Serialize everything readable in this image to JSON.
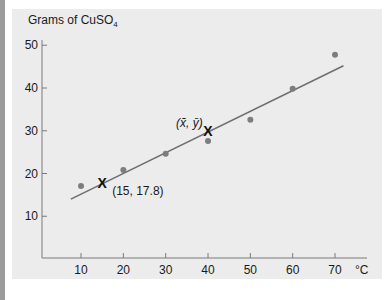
{
  "chart_data": {
    "type": "scatter",
    "title": "",
    "ylabel": "Grams of CuSO4",
    "ylabel_main": "Grams of CuSO",
    "ylabel_sub": "4",
    "xlabel": "°C",
    "xlim": [
      0,
      75
    ],
    "ylim": [
      0,
      50
    ],
    "x_ticks": [
      10,
      20,
      30,
      40,
      50,
      60,
      70
    ],
    "y_ticks": [
      10,
      20,
      30,
      40,
      50
    ],
    "grid": false,
    "series": [
      {
        "name": "data points",
        "x": [
          10,
          20,
          30,
          40,
          50,
          60,
          70
        ],
        "y": [
          17.1,
          20.8,
          24.6,
          27.6,
          32.6,
          39.8,
          47.8
        ]
      }
    ],
    "regression_line": {
      "x": [
        7.6,
        72
      ],
      "y": [
        14.0,
        45.2
      ]
    },
    "annotations": [
      {
        "label": "(15, 17.8)",
        "x": 15,
        "y": 17.8,
        "marker": "X"
      },
      {
        "label": "(x̄, ȳ)",
        "x": 40,
        "y": 29.9,
        "marker": "X"
      }
    ]
  },
  "labels": {
    "ylabel_main": "Grams of CuSO",
    "ylabel_sub": "4",
    "xunit": "°C",
    "point_label": "(15, 17.8)",
    "mean_label_x": "x̄",
    "mean_label_y": "ȳ"
  },
  "colors": {
    "panel": "#ececec",
    "axis": "#7a7a7a",
    "line": "#6e6e6e",
    "point": "#7d7d7d",
    "marker": "#111111"
  }
}
